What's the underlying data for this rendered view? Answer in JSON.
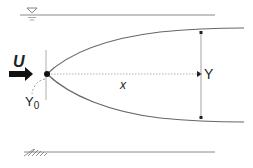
{
  "diagram": {
    "title": "",
    "labels": {
      "velocity": "U",
      "initial_width_main": "Y",
      "initial_width_sub": "0",
      "distance": "x",
      "width": "Y"
    },
    "elements": [
      {
        "name": "water-surface",
        "description": "free surface line with water-level triangle symbol"
      },
      {
        "name": "channel-bed",
        "description": "bottom boundary line with hatching"
      },
      {
        "name": "source-point",
        "description": "point source at origin"
      },
      {
        "name": "flow-arrow",
        "description": "bold arrow indicating incoming velocity U"
      },
      {
        "name": "plume-upper-boundary",
        "description": "upper spreading boundary curve"
      },
      {
        "name": "plume-lower-boundary",
        "description": "lower spreading boundary curve"
      },
      {
        "name": "centerline",
        "description": "dotted centerline arrow measuring x"
      },
      {
        "name": "width-dimension",
        "description": "double-headed vertical arrow measuring Y"
      },
      {
        "name": "initial-width-indicator",
        "description": "dashed arc indicating Y0"
      }
    ],
    "colors": {
      "line": "#555555",
      "dark": "#111111",
      "light": "#9a9a9a"
    }
  }
}
